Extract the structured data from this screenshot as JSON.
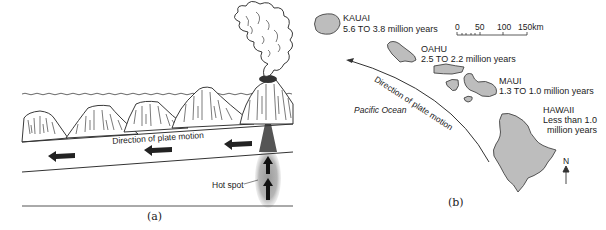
{
  "panel_a": {
    "caption": "(a)",
    "plate_label": "Direction of plate motion",
    "hotspot_label": "Hot spot",
    "volcano_count": 6,
    "plate_arrows": 3,
    "hotspot_arrows": 2
  },
  "panel_b": {
    "caption": "(b)",
    "ocean_label": "Pacific Ocean",
    "plate_label": "Direction of plate motion",
    "scale_bar": {
      "ticks": [
        "0",
        "50",
        "100",
        "150km"
      ]
    },
    "north_label": "N",
    "islands": [
      {
        "name": "KAUAI",
        "age": "5.6 TO 3.8 million years"
      },
      {
        "name": "OAHU",
        "age": "2.5 TO 2.2 million years"
      },
      {
        "name": "MAUI",
        "age": "1.3 TO 1.0 million years"
      },
      {
        "name": "HAWAII",
        "age_line1": "Less than 1.0",
        "age_line2": "million years"
      }
    ]
  },
  "colors": {
    "ink": "#222222",
    "land": "#bdbdbd",
    "hotspot": "#8a8a8a",
    "hotspot_plume": "#b8b8b8"
  }
}
